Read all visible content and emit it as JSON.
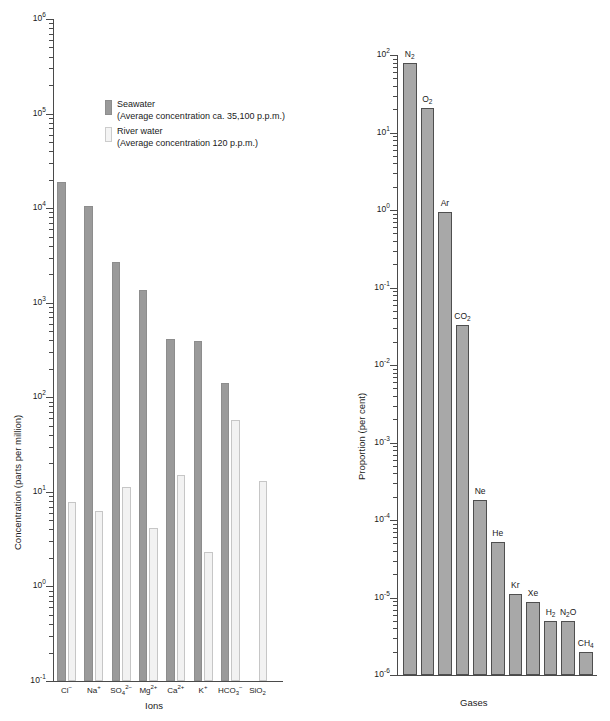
{
  "chart_data": [
    {
      "type": "bar",
      "title": "",
      "xlabel": "Ions",
      "ylabel": "Concentration (parts per million)",
      "scale": "log",
      "ylim": [
        0.1,
        1000000
      ],
      "ytick_labels": [
        "10-1",
        "10 0",
        "10 1",
        "10 2",
        "10 3",
        "10 4",
        "10 5",
        "10 6"
      ],
      "ytick_exponents": [
        "-1",
        "0",
        "1",
        "2",
        "3",
        "4",
        "5",
        "6"
      ],
      "grid": false,
      "legend_position": "upper-center-left",
      "categories": [
        "Cl−",
        "Na+",
        "SO4 2−",
        "Mg2+",
        "Ca2+",
        "K+",
        "HCO3−",
        "SiO2"
      ],
      "series": [
        {
          "name": "Seawater",
          "values": [
            19000,
            10500,
            2700,
            1350,
            410,
            390,
            140,
            null
          ]
        },
        {
          "name": "River water",
          "values": [
            7.8,
            6.3,
            11.2,
            4.1,
            15,
            2.3,
            58,
            13
          ]
        }
      ]
    },
    {
      "type": "bar",
      "title": "",
      "xlabel": "Gases",
      "ylabel": "Proportion (per cent)",
      "scale": "log",
      "ylim": [
        1e-06,
        100
      ],
      "ytick_labels": [
        "10-6",
        "10-5",
        "10-4",
        "10-3",
        "10-2",
        "10-1",
        "10 0",
        "10 1",
        "10 2"
      ],
      "ytick_exponents": [
        "-6",
        "-5",
        "-4",
        "-3",
        "-2",
        "-1",
        "0",
        "1",
        "2"
      ],
      "grid": false,
      "categories": [
        "N2",
        "O2",
        "Ar",
        "CO2",
        "Ne",
        "He",
        "Kr",
        "Xe",
        "H2",
        "N2O",
        "CH4"
      ],
      "values": [
        78.0,
        21.0,
        0.93,
        0.033,
        0.00018,
        5.2e-05,
        1.1e-05,
        8.7e-06,
        5e-06,
        5e-06,
        2e-06
      ]
    }
  ],
  "left_chart": {
    "ylabel": "Concentration (parts per million)",
    "xlabel": "Ions",
    "ytick_labels": [
      {
        "base": "10",
        "exp": "-1"
      },
      {
        "base": "10",
        "exp": "0"
      },
      {
        "base": "10",
        "exp": "1"
      },
      {
        "base": "10",
        "exp": "2"
      },
      {
        "base": "10",
        "exp": "3"
      },
      {
        "base": "10",
        "exp": "4"
      },
      {
        "base": "10",
        "exp": "5"
      },
      {
        "base": "10",
        "exp": "6"
      }
    ],
    "categories": [
      {
        "main": "Cl",
        "sup": "−",
        "sub": ""
      },
      {
        "main": "Na",
        "sup": "+",
        "sub": ""
      },
      {
        "main": "SO",
        "sub": "4",
        "sup": "2−"
      },
      {
        "main": "Mg",
        "sup": "2+",
        "sub": ""
      },
      {
        "main": "Ca",
        "sup": "2+",
        "sub": ""
      },
      {
        "main": "K",
        "sup": "+",
        "sub": ""
      },
      {
        "main": "HCO",
        "sub": "3",
        "sup": "−"
      },
      {
        "main": "SiO",
        "sub": "2",
        "sup": ""
      }
    ],
    "legend": [
      {
        "name": "Seawater",
        "detail": "(Average concentration ca. 35,100 p.p.m.)",
        "swatch": "sea"
      },
      {
        "name": "River water",
        "detail": "(Average concentration 120 p.p.m.)",
        "swatch": "river"
      }
    ]
  },
  "right_chart": {
    "ylabel": "Proportion (per cent)",
    "xlabel": "Gases",
    "ytick_labels": [
      {
        "base": "10",
        "exp": "-6"
      },
      {
        "base": "10",
        "exp": "-5"
      },
      {
        "base": "10",
        "exp": "-4"
      },
      {
        "base": "10",
        "exp": "-3"
      },
      {
        "base": "10",
        "exp": "-2"
      },
      {
        "base": "10",
        "exp": "-1"
      },
      {
        "base": "10",
        "exp": "0"
      },
      {
        "base": "10",
        "exp": "1"
      },
      {
        "base": "10",
        "exp": "2"
      }
    ],
    "bars": [
      {
        "main": "N",
        "sub": "2",
        "tail": ""
      },
      {
        "main": "O",
        "sub": "2",
        "tail": ""
      },
      {
        "main": "Ar",
        "sub": "",
        "tail": ""
      },
      {
        "main": "CO",
        "sub": "2",
        "tail": ""
      },
      {
        "main": "Ne",
        "sub": "",
        "tail": ""
      },
      {
        "main": "He",
        "sub": "",
        "tail": ""
      },
      {
        "main": "Kr",
        "sub": "",
        "tail": ""
      },
      {
        "main": "Xe",
        "sub": "",
        "tail": ""
      },
      {
        "main": "H",
        "sub": "2",
        "tail": ""
      },
      {
        "main": "N",
        "sub": "2",
        "tail": "O"
      },
      {
        "main": "CH",
        "sub": "4",
        "tail": ""
      }
    ]
  },
  "colors": {
    "seawater_bar": "#9a9a9a",
    "river_bar": "#f2f2f2",
    "gas_bar": "#a8a8a8",
    "axis": "#4a4a4a",
    "text": "#1a1a1a"
  }
}
